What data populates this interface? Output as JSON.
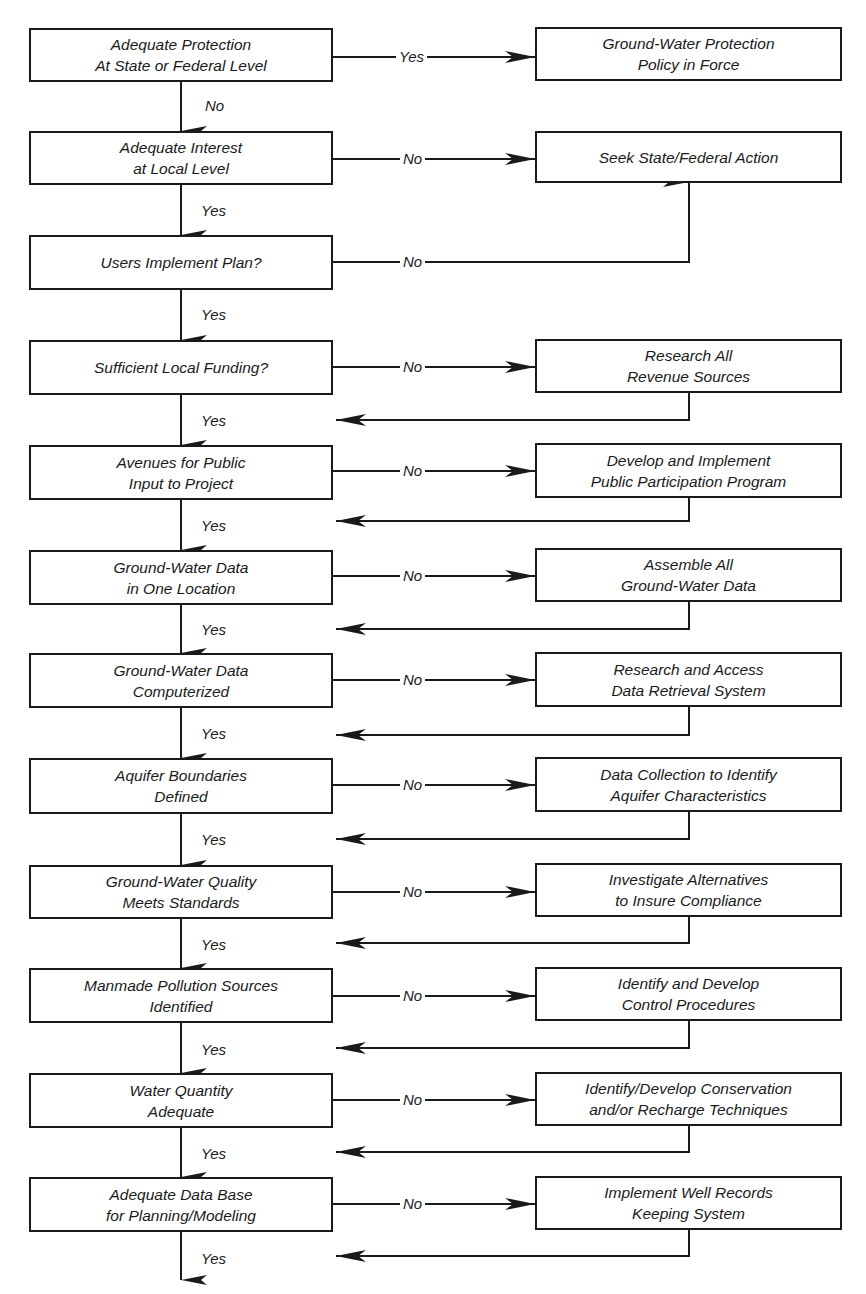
{
  "diagram": {
    "type": "flowchart",
    "start": {
      "decision": "Adequate Protection\nAt State or Federal Level",
      "yes_label": "Yes",
      "yes_target": "Ground-Water Protection\nPolicy in Force",
      "no_label": "No"
    },
    "row2": {
      "decision": "Adequate Interest\nat Local Level",
      "no_label": "No",
      "no_target": "Seek State/Federal Action",
      "yes_label": "Yes"
    },
    "row3": {
      "decision": "Users Implement Plan?",
      "no_label": "No",
      "yes_label": "Yes"
    },
    "steps": [
      {
        "decision": "Sufficient Local Funding?",
        "no_label": "No",
        "action": "Research All\nRevenue Sources",
        "yes_label": "Yes"
      },
      {
        "decision": "Avenues for Public\nInput to Project",
        "no_label": "No",
        "action": "Develop and Implement\nPublic Participation Program",
        "yes_label": "Yes"
      },
      {
        "decision": "Ground-Water Data\nin One Location",
        "no_label": "No",
        "action": "Assemble All\nGround-Water Data",
        "yes_label": "Yes"
      },
      {
        "decision": "Ground-Water Data\nComputerized",
        "no_label": "No",
        "action": "Research and Access\nData Retrieval System",
        "yes_label": "Yes"
      },
      {
        "decision": "Aquifer Boundaries\nDefined",
        "no_label": "No",
        "action": "Data Collection to Identify\nAquifer Characteristics",
        "yes_label": "Yes"
      },
      {
        "decision": "Ground-Water Quality\nMeets Standards",
        "no_label": "No",
        "action": "Investigate Alternatives\nto Insure Compliance",
        "yes_label": "Yes"
      },
      {
        "decision": "Manmade Pollution Sources\nIdentified",
        "no_label": "No",
        "action": "Identify and Develop\nControl Procedures",
        "yes_label": "Yes"
      },
      {
        "decision": "Water Quantity\nAdequate",
        "no_label": "No",
        "action": "Identify/Develop Conservation\nand/or Recharge Techniques",
        "yes_label": "Yes"
      },
      {
        "decision": "Adequate Data Base\nfor Planning/Modeling",
        "no_label": "No",
        "action": "Implement Well Records\nKeeping System",
        "yes_label": "Yes"
      }
    ]
  }
}
